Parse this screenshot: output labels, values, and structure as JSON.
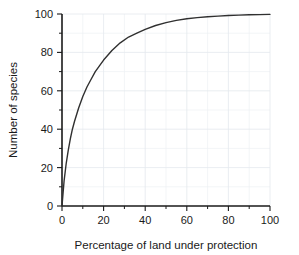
{
  "chart_data": {
    "type": "line",
    "title": "",
    "subtitle": "",
    "xlabel": "Percentage of land under protection",
    "ylabel": "Number of species",
    "xlim": [
      0,
      100
    ],
    "ylim": [
      0,
      100
    ],
    "xticks": [
      0,
      20,
      40,
      60,
      80,
      100
    ],
    "yticks": [
      0,
      20,
      40,
      60,
      80,
      100
    ],
    "xtick_labels": [
      "0",
      "20",
      "40",
      "60",
      "80",
      "100"
    ],
    "ytick_labels": [
      "0",
      "20",
      "40",
      "60",
      "80",
      "100"
    ],
    "xminor_ticks": [
      10,
      30,
      50,
      70,
      90
    ],
    "yminor_ticks": [
      10,
      30,
      50,
      70,
      90
    ],
    "grid": true,
    "grid_color": "#e8ecf0",
    "legend": false,
    "legend_position": "none",
    "line_color": "#303030",
    "line_width": 1.4,
    "series": [
      {
        "name": "species accumulation",
        "x": [
          0,
          1,
          2,
          3,
          4,
          5,
          6,
          8,
          10,
          12,
          14,
          16,
          18,
          20,
          24,
          28,
          32,
          36,
          40,
          45,
          50,
          55,
          60,
          65,
          70,
          75,
          80,
          85,
          90,
          95,
          100
        ],
        "values": [
          0,
          13,
          22,
          29,
          35,
          40,
          44,
          51,
          57,
          62,
          66,
          70,
          73,
          76,
          81,
          85,
          88,
          90,
          92,
          94,
          95.5,
          96.7,
          97.5,
          98.1,
          98.6,
          98.9,
          99.2,
          99.4,
          99.6,
          99.7,
          99.8
        ]
      }
    ],
    "annotations": []
  },
  "axes": {
    "x_title": "Percentage of land under protection",
    "y_title": "Number of species"
  }
}
